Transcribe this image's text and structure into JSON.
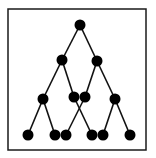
{
  "diagram": {
    "type": "tree",
    "frame": {
      "x": 8,
      "y": 9,
      "width": 138,
      "height": 141,
      "stroke": "#1a1a1a",
      "stroke_width": 1.5
    },
    "node_color": "#000000",
    "edge_color": "#111111",
    "node_radius": 5.5,
    "nodes": [
      {
        "id": "n0",
        "x": 80,
        "y": 25
      },
      {
        "id": "n1",
        "x": 62,
        "y": 60
      },
      {
        "id": "n2",
        "x": 97,
        "y": 61
      },
      {
        "id": "n3",
        "x": 43,
        "y": 99
      },
      {
        "id": "n4",
        "x": 74,
        "y": 97
      },
      {
        "id": "n5",
        "x": 85,
        "y": 97
      },
      {
        "id": "n6",
        "x": 115,
        "y": 99
      },
      {
        "id": "n7",
        "x": 28,
        "y": 135
      },
      {
        "id": "n8",
        "x": 55,
        "y": 135
      },
      {
        "id": "n9",
        "x": 66,
        "y": 135
      },
      {
        "id": "n10",
        "x": 92,
        "y": 135
      },
      {
        "id": "n11",
        "x": 103,
        "y": 135
      },
      {
        "id": "n12",
        "x": 130,
        "y": 135
      }
    ],
    "edges": [
      [
        "n0",
        "n1"
      ],
      [
        "n0",
        "n2"
      ],
      [
        "n1",
        "n3"
      ],
      [
        "n1",
        "n4"
      ],
      [
        "n2",
        "n5"
      ],
      [
        "n2",
        "n6"
      ],
      [
        "n3",
        "n7"
      ],
      [
        "n3",
        "n8"
      ],
      [
        "n5",
        "n9"
      ],
      [
        "n4",
        "n10"
      ],
      [
        "n6",
        "n11"
      ],
      [
        "n6",
        "n12"
      ]
    ]
  }
}
